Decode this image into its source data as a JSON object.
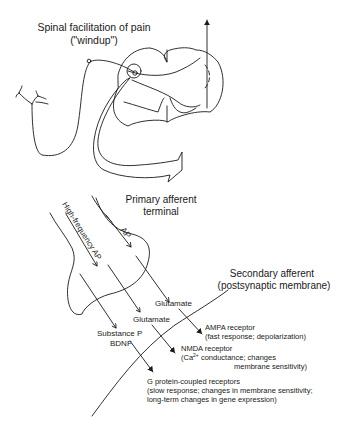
{
  "title": {
    "line1": "Spinal facilitation of pain",
    "line2": "(\"windup\")"
  },
  "labels": {
    "primary_afferent_line1": "Primary afferent",
    "primary_afferent_line2": "terminal",
    "secondary_afferent_line1": "Secondary afferent",
    "secondary_afferent_line2": "(postsynaptic membrane)",
    "ap": "AP",
    "high_frequency_ap": "High-frequency AP",
    "glutamate_1": "Glutamate",
    "glutamate_2": "Glutamate",
    "substance_p": "Substance P",
    "bdnf": "BDNF"
  },
  "receptors": [
    {
      "name": "AMPA receptor",
      "desc1": "(fast response; depolarization)",
      "desc2": ""
    },
    {
      "name": "NMDA receptor",
      "desc1_pre": "(Ca",
      "desc1_sup": "2+",
      "desc1_post": " conductance; changes",
      "desc2": "membrane sensitivity)"
    },
    {
      "name": "G protein-coupled receptors",
      "desc1": "(slow response; changes in membrane sensitivity;",
      "desc2": "long-term changes in gene expression)"
    }
  ],
  "colors": {
    "ink": "#1a1a1a",
    "background": "#ffffff"
  }
}
